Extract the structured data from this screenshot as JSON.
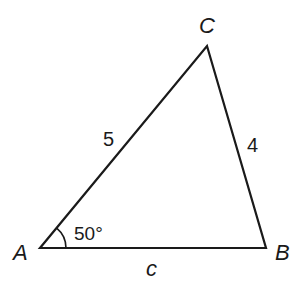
{
  "diagram": {
    "type": "triangle",
    "vertices": {
      "A": {
        "label": "A"
      },
      "B": {
        "label": "B"
      },
      "C": {
        "label": "C"
      }
    },
    "sides": {
      "AC": {
        "label": "5"
      },
      "BC": {
        "label": "4"
      },
      "AB": {
        "label": "c"
      }
    },
    "angles": {
      "A": {
        "label": "50°"
      }
    },
    "colors": {
      "stroke": "#1a1a1a",
      "background": "#ffffff"
    }
  }
}
